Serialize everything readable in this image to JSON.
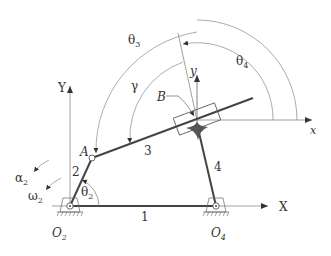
{
  "diagram": {
    "type": "four-bar linkage with slider (inverted slider-crank)",
    "colors": {
      "link": "#444444",
      "thin": "#777777",
      "arc": "#888888",
      "fill": "#555555",
      "text": "#333333"
    },
    "global_axes": {
      "x_label": "X",
      "y_label": "Y"
    },
    "local_axes": {
      "x_label": "x",
      "y_label": "y"
    },
    "points": {
      "O2": "O",
      "O2_sub": "2",
      "O4": "O",
      "O4_sub": "4",
      "A": "A",
      "B": "B"
    },
    "links": {
      "link1": "1",
      "link2": "2",
      "link3": "3",
      "link4": "4"
    },
    "angles": {
      "theta2": "θ",
      "theta2_sub": "2",
      "theta3": "θ",
      "theta3_sub": "3",
      "theta4": "θ",
      "theta4_sub": "4",
      "gamma": "γ"
    },
    "kinematics": {
      "alpha2": "α",
      "alpha2_sub": "2",
      "omega2": "ω",
      "omega2_sub": "2"
    }
  }
}
